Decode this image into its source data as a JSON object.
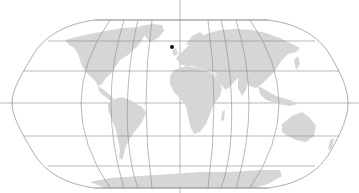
{
  "map": {
    "projection": "Robinson",
    "background_color": "#ffffff",
    "land_color": "#d6d6d6",
    "graticule_color": "#8a8a8a",
    "graticule_step_degrees": 30,
    "parallels_y": [
      20,
      41,
      71,
      103,
      136,
      166,
      188
    ],
    "meridians_x_at_equator": [
      14,
      41,
      69,
      96,
      124,
      152,
      180,
      207,
      235,
      263,
      290,
      318,
      345
    ],
    "markers": [
      {
        "label": "point",
        "x": 172,
        "y": 47,
        "color": "#111111",
        "radius": 2
      }
    ]
  }
}
